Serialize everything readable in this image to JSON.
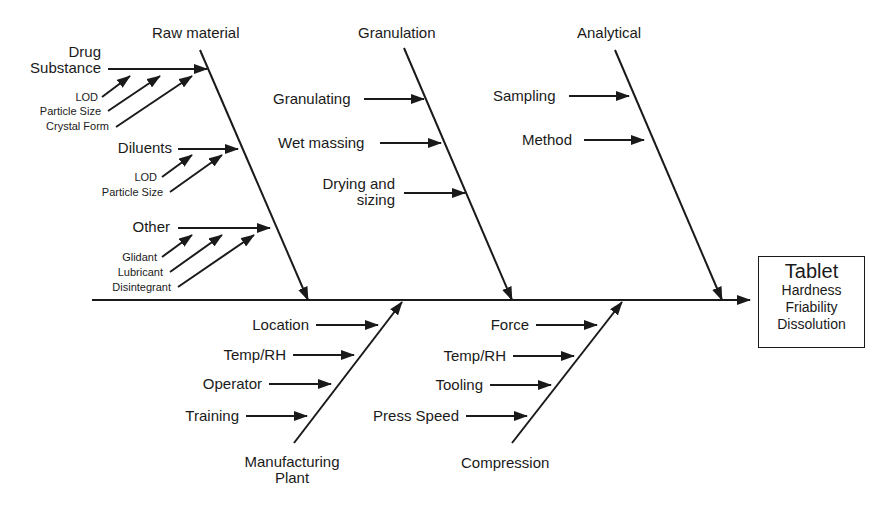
{
  "effect": {
    "title": "Tablet",
    "attributes": [
      "Hardness",
      "Friability",
      "Dissolution"
    ]
  },
  "categories": {
    "raw_material": {
      "label": "Raw material",
      "causes": [
        {
          "label": "Drug Substance",
          "line1": "Drug",
          "line2": "Substance",
          "sub_causes": [
            "LOD",
            "Particle Size",
            "Crystal Form"
          ]
        },
        {
          "label": "Diluents",
          "sub_causes": [
            "LOD",
            "Particle Size"
          ]
        },
        {
          "label": "Other",
          "sub_causes": [
            "Glidant",
            "Lubricant",
            "Disintegrant"
          ]
        }
      ]
    },
    "granulation": {
      "label": "Granulation",
      "causes": [
        "Granulating",
        "Wet massing",
        "Drying and sizing"
      ],
      "cause3_line1": "Drying and",
      "cause3_line2": "sizing"
    },
    "analytical": {
      "label": "Analytical",
      "causes": [
        "Sampling",
        "Method"
      ]
    },
    "manufacturing_plant": {
      "label": "Manufacturing Plant",
      "line1": "Manufacturing",
      "line2": "Plant",
      "causes": [
        "Location",
        "Temp/RH",
        "Operator",
        "Training"
      ]
    },
    "compression": {
      "label": "Compression",
      "causes": [
        "Force",
        "Temp/RH",
        "Tooling",
        "Press Speed"
      ]
    }
  },
  "colors": {
    "ink": "#1a1a1a",
    "background": "#ffffff"
  }
}
